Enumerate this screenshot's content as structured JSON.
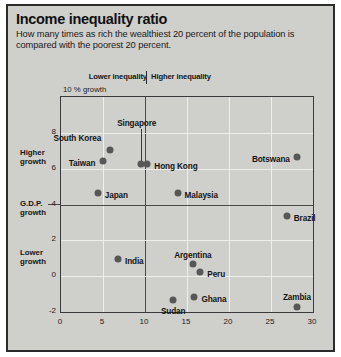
{
  "header": {
    "title": "Income inequality ratio",
    "subtitle": "How many times as rich the wealthiest 20 percent of the population is compared with the poorest 20 percent."
  },
  "banner": {
    "lower": "Lower inequality",
    "higher": "Higher inequality"
  },
  "axis_notes": {
    "y_unit": "10 % growth",
    "higher_growth": "Higher\ngrowth",
    "higher_growth_l1": "Higher",
    "higher_growth_l2": "growth",
    "gdp_growth_l1": "G.D.P.",
    "gdp_growth_l2": "growth",
    "lower_growth_l1": "Lower",
    "lower_growth_l2": "growth"
  },
  "chart_data": {
    "type": "scatter",
    "title": "Income inequality ratio",
    "subtitle": "How many times as rich the wealthiest 20 percent of the population is compared with the poorest 20 percent.",
    "xlabel": "Income inequality ratio",
    "ylabel": "G.D.P. growth (%)",
    "xlim": [
      0,
      30
    ],
    "ylim": [
      -2,
      10
    ],
    "xticks": [
      0,
      5,
      10,
      15,
      20,
      25,
      30
    ],
    "yticks": [
      -2,
      0,
      2,
      4,
      6,
      8,
      10
    ],
    "ytick_labels": [
      "-2",
      "0",
      "2",
      "4",
      "6",
      "8",
      "10 % growth"
    ],
    "grid": true,
    "legend": "none",
    "reference_lines": [
      {
        "axis": "x",
        "value": 10,
        "note": "divides lower inequality from higher inequality"
      },
      {
        "axis": "y",
        "value": 4,
        "note": "G.D.P. growth reference"
      }
    ],
    "annotations": [
      {
        "text": "Lower inequality",
        "position": "above-plot-left-of-x=10"
      },
      {
        "text": "Higher inequality",
        "position": "above-plot-right-of-x=10"
      },
      {
        "text": "Higher growth",
        "position": "left-axis-upper"
      },
      {
        "text": "G.D.P. growth",
        "position": "left-axis-at-y=4"
      },
      {
        "text": "Lower growth",
        "position": "left-axis-lower"
      }
    ],
    "points": [
      {
        "label": "Singapore",
        "x": 9.6,
        "y": 6.2,
        "label_dx": -4,
        "label_dy": -40,
        "anchor": "middle",
        "leader": true
      },
      {
        "label": "South Korea",
        "x": 5.9,
        "y": 7.0,
        "label_dx": -8,
        "label_dy": -11,
        "anchor": "end",
        "leader": false
      },
      {
        "label": "Taiwan",
        "x": 5.1,
        "y": 6.4,
        "label_dx": -7,
        "label_dy": 3,
        "anchor": "end",
        "leader": false
      },
      {
        "label": "Hong Kong",
        "x": 10.4,
        "y": 6.2,
        "label_dx": 7,
        "label_dy": 3,
        "anchor": "start",
        "leader": false
      },
      {
        "label": "Botswana",
        "x": 28.2,
        "y": 6.6,
        "label_dx": -7,
        "label_dy": 3,
        "anchor": "end",
        "leader": false
      },
      {
        "label": "Japan",
        "x": 4.5,
        "y": 4.6,
        "label_dx": 7,
        "label_dy": 3,
        "anchor": "start",
        "leader": false
      },
      {
        "label": "Malaysia",
        "x": 14.0,
        "y": 4.6,
        "label_dx": 7,
        "label_dy": 3,
        "anchor": "start",
        "leader": false
      },
      {
        "label": "Brazil",
        "x": 27.0,
        "y": 3.3,
        "label_dx": 7,
        "label_dy": 3,
        "anchor": "start",
        "leader": false
      },
      {
        "label": "India",
        "x": 6.9,
        "y": 0.9,
        "label_dx": 7,
        "label_dy": 3,
        "anchor": "start",
        "leader": false
      },
      {
        "label": "Argentina",
        "x": 15.8,
        "y": 0.6,
        "label_dx": 0,
        "label_dy": -8,
        "anchor": "middle",
        "leader": false
      },
      {
        "label": "Peru",
        "x": 16.7,
        "y": 0.2,
        "label_dx": 7,
        "label_dy": 3,
        "anchor": "start",
        "leader": false
      },
      {
        "label": "Ghana",
        "x": 16.0,
        "y": -1.2,
        "label_dx": 7,
        "label_dy": 3,
        "anchor": "start",
        "leader": false
      },
      {
        "label": "Sudan",
        "x": 13.5,
        "y": -1.4,
        "label_dx": 0,
        "label_dy": 12,
        "anchor": "middle",
        "leader": false
      },
      {
        "label": "Zambia",
        "x": 28.2,
        "y": -1.8,
        "label_dx": 0,
        "label_dy": -9,
        "anchor": "middle",
        "leader": false
      }
    ]
  },
  "colors": {
    "page_background": "#ffffff",
    "figure_background": "#cfcfcb",
    "border": "#2b2b2b",
    "gridline": "#efefec",
    "reference_line": "#4a4a4a",
    "marker": "#575757",
    "text": "#141414"
  }
}
